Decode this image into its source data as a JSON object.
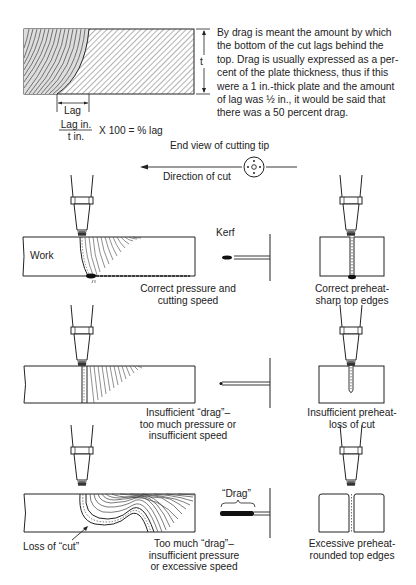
{
  "intro": {
    "lines": [
      "By drag is meant the amount by which",
      "the bottom of the cut lags behind the",
      "top. Drag is usually expressed as a per-",
      "cent of the plate thickness, thus if this",
      "were a 1 in.-thick plate and the amount",
      "of lag was ½ in., it would be said that",
      "there was a 50 percent drag."
    ]
  },
  "plate_diagram": {
    "thickness_label": "t",
    "lag_label": "Lag"
  },
  "formula": {
    "numerator": "Lag in.",
    "denominator": "t in.",
    "rest": "X 100 = % lag"
  },
  "tip_view": {
    "title": "End view of cutting tip",
    "direction_label": "Direction of cut"
  },
  "rows": [
    {
      "side_label": "Work",
      "kerf_label": "Kerf",
      "side_caption": [
        "Correct pressure and",
        "cutting speed"
      ],
      "end_caption": [
        "Correct preheat-",
        "sharp top edges"
      ]
    },
    {
      "side_caption": [
        "Insufficient “drag”–",
        "too much pressure or",
        "insufficient speed"
      ],
      "end_caption": [
        "Insufficient preheat-",
        "loss of cut"
      ]
    },
    {
      "drag_label": "“Drag”",
      "loss_label": "Loss of “cut”",
      "side_caption": [
        "Too much “drag”–",
        "insufficient pressure",
        "or excessive speed"
      ],
      "end_caption": [
        "Excessive preheat-",
        "rounded top edges"
      ]
    }
  ],
  "colors": {
    "line": "#2a2a2a",
    "hatch": "#555555",
    "background": "#ffffff"
  }
}
